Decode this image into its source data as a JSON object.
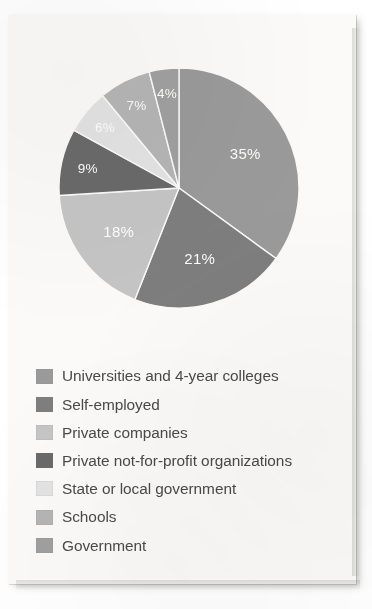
{
  "chart_data": {
    "type": "pie",
    "title": "",
    "subtitle": "",
    "xlabel": "",
    "ylabel": "",
    "legend_position": "bottom-left",
    "grid": false,
    "unit": "%",
    "categories": [
      "Universities and 4-year colleges",
      "Self-employed",
      "Private companies",
      "Private not-for-profit organizations",
      "State or local government",
      "Schools",
      "Government"
    ],
    "values": [
      35,
      21,
      18,
      9,
      6,
      7,
      4
    ],
    "data_labels": [
      "35%",
      "21%",
      "18%",
      "9%",
      "6%",
      "7%",
      "4%"
    ],
    "colors": [
      "#9a9a9a",
      "#7e7e7e",
      "#c5c5c5",
      "#6a6a6a",
      "#e3e3e3",
      "#b5b5b5",
      "#a0a0a0"
    ],
    "start_angle_deg": 0,
    "direction": "clockwise"
  },
  "pie": {
    "slices": [
      {
        "name": "Universities and 4-year colleges",
        "value": 35,
        "label": "35%",
        "color": "#9a9a9a"
      },
      {
        "name": "Self-employed",
        "value": 21,
        "label": "21%",
        "color": "#7e7e7e"
      },
      {
        "name": "Private companies",
        "value": 18,
        "label": "18%",
        "color": "#c5c5c5"
      },
      {
        "name": "Private not-for-profit organizations",
        "value": 9,
        "label": "9%",
        "color": "#6a6a6a"
      },
      {
        "name": "State or local government",
        "value": 6,
        "label": "6%",
        "color": "#e3e3e3"
      },
      {
        "name": "Schools",
        "value": 7,
        "label": "7%",
        "color": "#b5b5b5"
      },
      {
        "name": "Government",
        "value": 4,
        "label": "4%",
        "color": "#a0a0a0"
      }
    ]
  },
  "legend": {
    "items": [
      {
        "label": "Universities and 4-year colleges",
        "color": "#9a9a9a"
      },
      {
        "label": "Self-employed",
        "color": "#7e7e7e"
      },
      {
        "label": "Private companies",
        "color": "#c5c5c5"
      },
      {
        "label": "Private not-for-profit organizations",
        "color": "#6a6a6a"
      },
      {
        "label": "State or local government",
        "color": "#e3e3e3"
      },
      {
        "label": "Schools",
        "color": "#b5b5b5"
      },
      {
        "label": "Government",
        "color": "#a0a0a0"
      }
    ]
  },
  "slice_label_text": {
    "s0": "35%",
    "s1": "21%",
    "s2": "18%",
    "s3": "9%",
    "s4": "6%",
    "s5": "7%",
    "s6": "4%"
  }
}
